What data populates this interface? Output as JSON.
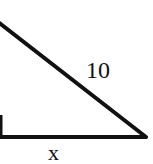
{
  "figure": {
    "type": "right-triangle",
    "stroke_color": "#111111",
    "background": "#ffffff",
    "labels": {
      "hypotenuse": "10",
      "base": "x"
    },
    "right_angle_marker": true
  }
}
